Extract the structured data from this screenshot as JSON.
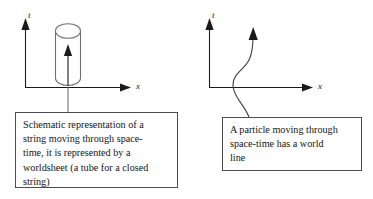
{
  "figure": {
    "background_color": "#ffffff",
    "ink_color": "#1a1a1a",
    "box_border_color": "#4a4a5a",
    "panels": [
      {
        "id": "string-worldsheet-panel",
        "axes": {
          "vertical_axis_label": "t",
          "horizontal_axis_label": "x"
        },
        "object": "cylinder-worldsheet",
        "object_description": "vertical tube (cylinder) with upward arrow through its axis",
        "caption": "Schematic representation of a\nstring moving through space-\ntime, it is represented by a\nworldsheet (a tube for a closed\nstring)"
      },
      {
        "id": "particle-worldline-panel",
        "axes": {
          "vertical_axis_label": "t",
          "horizontal_axis_label": "x"
        },
        "object": "wavy-worldline",
        "object_description": "S-shaped curve with an upward arrowhead at the top",
        "caption": "A particle moving through\nspace-time has a world\nline"
      }
    ]
  }
}
